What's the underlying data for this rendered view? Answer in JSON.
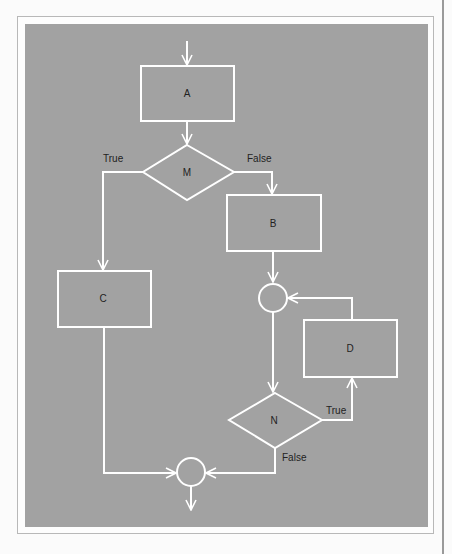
{
  "diagram": {
    "type": "flowchart",
    "colors": {
      "background": "#a2a2a2",
      "stroke": "#ffffff",
      "text": "#222222",
      "page": "#fbfbfb"
    },
    "nodes": {
      "A": {
        "label": "A",
        "shape": "process"
      },
      "M": {
        "label": "M",
        "shape": "decision"
      },
      "B": {
        "label": "B",
        "shape": "process"
      },
      "C": {
        "label": "C",
        "shape": "process"
      },
      "D": {
        "label": "D",
        "shape": "process"
      },
      "N": {
        "label": "N",
        "shape": "decision"
      },
      "J1": {
        "label": "",
        "shape": "connector"
      },
      "J2": {
        "label": "",
        "shape": "connector"
      }
    },
    "edges": {
      "m_true": "True",
      "m_false": "False",
      "n_true": "True",
      "n_false": "False"
    }
  }
}
